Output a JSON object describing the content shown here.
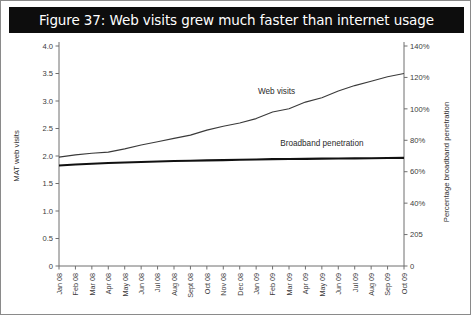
{
  "title": "Figure 37: Web visits grew much faster than internet usage",
  "chart_data": {
    "type": "line",
    "title": "Figure 37: Web visits grew much faster than internet usage",
    "xlabel": "",
    "ylabel": "MAT web visits",
    "y2label": "Percentage broadband penetration",
    "grid": false,
    "legend_position": "inline-annotations",
    "ylim": [
      0,
      4.0
    ],
    "y2lim": [
      0,
      140
    ],
    "yticks": [
      "0",
      "0.5",
      "1.0",
      "1.5",
      "2.0",
      "2.5",
      "3.0",
      "3.5",
      "4.0"
    ],
    "ytick_values": [
      0,
      0.5,
      1.0,
      1.5,
      2.0,
      2.5,
      3.0,
      3.5,
      4.0
    ],
    "y2ticks": [
      "0",
      "205",
      "40%",
      "60%",
      "80%",
      "100%",
      "120%",
      "140%"
    ],
    "y2tick_values": [
      0,
      20,
      40,
      60,
      80,
      100,
      120,
      140
    ],
    "categories": [
      "Jan 08",
      "Feb 08",
      "Mar 08",
      "Apr 08",
      "May 08",
      "Jun 08",
      "Jul 08",
      "Aug 08",
      "Sept 08",
      "Oct 08",
      "Nov 08",
      "Dec 08",
      "Jan 09",
      "Feb 09",
      "Mar 09",
      "Apr 09",
      "May 09",
      "Jun 09",
      "Jul 09",
      "Aug 09",
      "Sep 09",
      "Oct 09"
    ],
    "series": [
      {
        "name": "Web visits",
        "axis": "left",
        "units": "MAT web visits",
        "values": [
          1.98,
          2.02,
          2.05,
          2.07,
          2.13,
          2.2,
          2.26,
          2.32,
          2.38,
          2.47,
          2.54,
          2.6,
          2.68,
          2.8,
          2.86,
          2.98,
          3.06,
          3.18,
          3.28,
          3.36,
          3.44,
          3.5
        ]
      },
      {
        "name": "Broadband penetration",
        "axis": "right",
        "units": "Percentage broadband penetration",
        "values": [
          64.0,
          64.6,
          65.1,
          65.5,
          65.9,
          66.2,
          66.5,
          66.8,
          67.0,
          67.2,
          67.4,
          67.6,
          67.8,
          68.0,
          68.1,
          68.2,
          68.3,
          68.4,
          68.5,
          68.6,
          68.7,
          68.8
        ]
      }
    ],
    "annotations": [
      {
        "text": "Web visits",
        "series": "Web visits"
      },
      {
        "text": "Broadband penetration",
        "series": "Broadband penetration"
      }
    ]
  }
}
